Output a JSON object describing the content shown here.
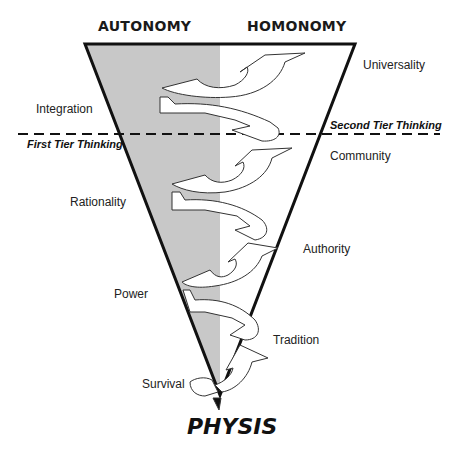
{
  "headers": {
    "left": "AUTONOMY",
    "right": "HOMONOMY"
  },
  "tiers": {
    "upper": "Second Tier Thinking",
    "lower": "First Tier Thinking"
  },
  "left_stages": [
    {
      "label": "Integration"
    },
    {
      "label": "Rationality"
    },
    {
      "label": "Power"
    },
    {
      "label": "Survival"
    }
  ],
  "right_stages": [
    {
      "label": "Universality"
    },
    {
      "label": "Community"
    },
    {
      "label": "Authority"
    },
    {
      "label": "Tradition"
    }
  ],
  "base": {
    "label": "PHYSIS"
  },
  "colors": {
    "autonomy_fill": "#c8c8c8",
    "outline": "#111111",
    "arrow_fill": "#ffffff"
  }
}
